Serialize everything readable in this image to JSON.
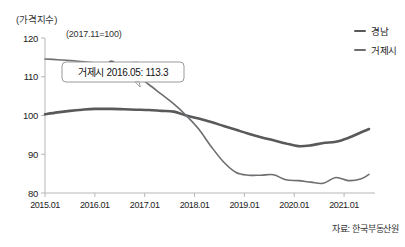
{
  "chart_data": {
    "type": "line",
    "title": "",
    "ylabel": "(가격지수)",
    "xlabel": "",
    "base_note": "(2017.11=100)",
    "source": "자료: 한국부동산원",
    "ylim": [
      80,
      120
    ],
    "yticks": [
      80,
      90,
      100,
      110,
      120
    ],
    "ytick_labels": [
      "80",
      "90",
      "100",
      "110",
      "120"
    ],
    "xlim": [
      "2015.01",
      "2021.07"
    ],
    "xticks": [
      "2015.01",
      "2016.01",
      "2017.01",
      "2018.01",
      "2019.01",
      "2020.01",
      "2021.01"
    ],
    "grid": false,
    "legend_position": "top-right",
    "annotation": {
      "label": "거제시 2016.05: 113.3",
      "series": "거제시",
      "x": "2016.05",
      "y": 113.3
    },
    "x": [
      "2015.01",
      "2015.04",
      "2015.07",
      "2015.10",
      "2016.01",
      "2016.05",
      "2016.08",
      "2016.11",
      "2017.02",
      "2017.05",
      "2017.08",
      "2017.11",
      "2018.02",
      "2018.05",
      "2018.08",
      "2018.11",
      "2019.02",
      "2019.05",
      "2019.08",
      "2019.11",
      "2020.02",
      "2020.05",
      "2020.08",
      "2020.11",
      "2021.02",
      "2021.05",
      "2021.07"
    ],
    "series": [
      {
        "name": "경남",
        "color": "#58595b",
        "width": 2.6,
        "values": [
          100.3,
          100.8,
          101.2,
          101.5,
          101.7,
          101.7,
          101.6,
          101.5,
          101.4,
          101.2,
          101.0,
          100.0,
          99.2,
          98.3,
          97.3,
          96.3,
          95.3,
          94.4,
          93.6,
          92.8,
          92.1,
          92.3,
          92.9,
          93.2,
          94.2,
          95.6,
          96.5
        ]
      },
      {
        "name": "거제시",
        "color": "#6d6e71",
        "width": 1.6,
        "values": [
          114.6,
          114.4,
          114.2,
          113.9,
          113.6,
          113.3,
          112.0,
          110.3,
          108.0,
          105.5,
          103.0,
          100.0,
          96.5,
          92.0,
          88.0,
          85.3,
          84.6,
          84.6,
          84.7,
          83.4,
          83.2,
          82.8,
          82.5,
          84.0,
          83.2,
          83.6,
          84.8
        ]
      }
    ]
  }
}
